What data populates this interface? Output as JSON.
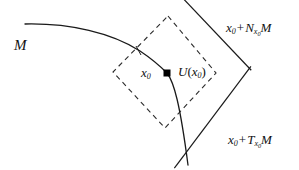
{
  "figure": {
    "type": "geometry-diagram",
    "background_color": "#ffffff",
    "stroke_color": "#1a1a1a"
  },
  "labels": {
    "manifold": "M",
    "normal_prefix": "x",
    "normal_sub": "0",
    "normal_op": "+",
    "normal_letter": "N",
    "normal_letter_sub_var": "x",
    "normal_letter_sub_num": "0",
    "normal_suffix": "M",
    "tangent_prefix": "x",
    "tangent_sub": "0",
    "tangent_op": "+",
    "tangent_letter": "T",
    "tangent_letter_sub_var": "x",
    "tangent_letter_sub_num": "0",
    "tangent_suffix": "M",
    "point_var": "x",
    "point_sub": "0",
    "neighbourhood_fn": "U",
    "neighbourhood_open": "(",
    "neighbourhood_var": "x",
    "neighbourhood_sub": "0",
    "neighbourhood_close": ")"
  },
  "geometry": {
    "point_x0": {
      "x": 167,
      "y": 73,
      "marker": "filled-square",
      "size": 7
    },
    "curve_M": "M25,24 C70,23 112,33 140,51 C152,59 161,67 167,73 C174,82 180,104 188,165",
    "tangent_line": {
      "x1": 100,
      "y1": 141,
      "x2": 227,
      "y2": 132
    },
    "normal_line": {
      "x1": 107,
      "y1": 10,
      "x2": 223,
      "y2": 10
    },
    "dashed_diamond": [
      {
        "x": 168,
        "y": 16
      },
      {
        "x": 216,
        "y": 73
      },
      {
        "x": 165,
        "y": 128
      },
      {
        "x": 113,
        "y": 72
      }
    ],
    "dash_pattern": "5,4"
  }
}
